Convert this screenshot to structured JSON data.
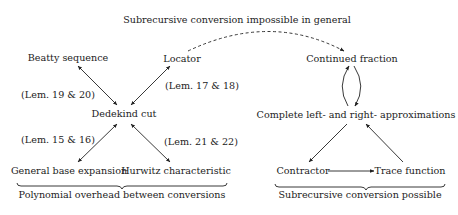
{
  "title": "Subrecursive conversion impossible in general",
  "nodes": {
    "beatty": "Beatty sequence",
    "locator": "Locator",
    "continued_fraction": "Continued fraction",
    "dedekind": "Dedekind cut",
    "complete_approx": "Complete left- and right- approximations",
    "general_base": "General base expansion",
    "hurwitz": "Hurwitz characteristic",
    "contractor": "Contractor",
    "trace": "Trace function"
  },
  "edge_labels": {
    "beatty_dedekind": "(Lem. 19 & 20)",
    "locator_dedekind": "(Lem. 17 & 18)",
    "general_dedekind": "(Lem. 15 & 16)",
    "hurwitz_dedekind": "(Lem. 21 & 22)"
  },
  "groups": {
    "left": "Polynomial overhead between conversions",
    "right": "Subrecursive conversion possible"
  },
  "colors": {
    "ink": "#222222",
    "background": "#ffffff"
  }
}
